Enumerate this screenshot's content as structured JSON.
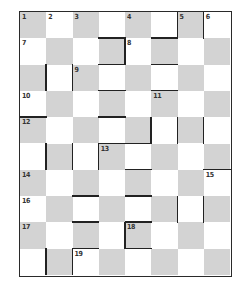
{
  "puzzle": {
    "type": "crossword-grid",
    "cols": 8,
    "rows": 10,
    "colors": {
      "shaded": "#d3d3d3",
      "white": "#ffffff",
      "wall": "#222222"
    },
    "numbers": [
      {
        "n": "1",
        "r": 0,
        "c": 0
      },
      {
        "n": "2",
        "r": 0,
        "c": 1
      },
      {
        "n": "3",
        "r": 0,
        "c": 2
      },
      {
        "n": "4",
        "r": 0,
        "c": 4
      },
      {
        "n": "5",
        "r": 0,
        "c": 6
      },
      {
        "n": "6",
        "r": 0,
        "c": 7
      },
      {
        "n": "7",
        "r": 1,
        "c": 0
      },
      {
        "n": "8",
        "r": 1,
        "c": 4
      },
      {
        "n": "9",
        "r": 2,
        "c": 2
      },
      {
        "n": "10",
        "r": 3,
        "c": 0
      },
      {
        "n": "11",
        "r": 3,
        "c": 5
      },
      {
        "n": "12",
        "r": 4,
        "c": 0
      },
      {
        "n": "13",
        "r": 5,
        "c": 3
      },
      {
        "n": "14",
        "r": 6,
        "c": 0
      },
      {
        "n": "15",
        "r": 6,
        "c": 7
      },
      {
        "n": "16",
        "r": 7,
        "c": 0
      },
      {
        "n": "17",
        "r": 8,
        "c": 0
      },
      {
        "n": "18",
        "r": 8,
        "c": 4
      },
      {
        "n": "19",
        "r": 9,
        "c": 2
      }
    ],
    "h_walls": [
      {
        "r": 1,
        "c": 5
      },
      {
        "r": 1,
        "c": 3
      },
      {
        "r": 2,
        "c": 3
      },
      {
        "r": 2,
        "c": 5
      },
      {
        "r": 3,
        "c": 3
      },
      {
        "r": 3,
        "c": 5
      },
      {
        "r": 4,
        "c": 0
      },
      {
        "r": 4,
        "c": 3
      },
      {
        "r": 5,
        "c": 3
      },
      {
        "r": 5,
        "c": 4
      },
      {
        "r": 6,
        "c": 4
      },
      {
        "r": 6,
        "c": 7
      },
      {
        "r": 7,
        "c": 2
      },
      {
        "r": 7,
        "c": 4
      },
      {
        "r": 8,
        "c": 2
      },
      {
        "r": 8,
        "c": 4
      },
      {
        "r": 9,
        "c": 2
      },
      {
        "r": 9,
        "c": 4
      }
    ],
    "v_walls": [
      {
        "r": 0,
        "c": 6
      },
      {
        "r": 0,
        "c": 7
      },
      {
        "r": 1,
        "c": 4
      },
      {
        "r": 2,
        "c": 1
      },
      {
        "r": 2,
        "c": 2
      },
      {
        "r": 4,
        "c": 5
      },
      {
        "r": 4,
        "c": 6
      },
      {
        "r": 4,
        "c": 7
      },
      {
        "r": 5,
        "c": 1
      },
      {
        "r": 5,
        "c": 2
      },
      {
        "r": 5,
        "c": 3
      },
      {
        "r": 7,
        "c": 6
      },
      {
        "r": 7,
        "c": 7
      },
      {
        "r": 8,
        "c": 4
      },
      {
        "r": 9,
        "c": 1
      },
      {
        "r": 9,
        "c": 2
      }
    ]
  }
}
